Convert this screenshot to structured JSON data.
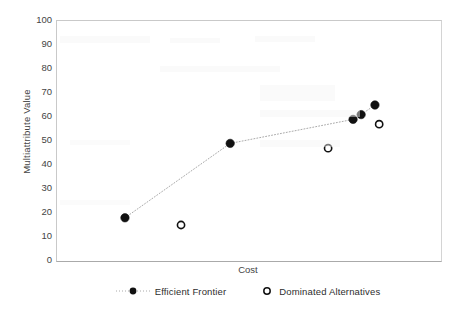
{
  "chart_data": {
    "type": "scatter",
    "title": "",
    "xlabel": "Cost",
    "ylabel": "Multiattribute Value",
    "ylim": [
      0,
      100
    ],
    "ytick_labels": [
      "100",
      "90",
      "80",
      "70",
      "60",
      "50",
      "40",
      "30",
      "20",
      "10",
      "0"
    ],
    "ytick_values": [
      100,
      90,
      80,
      70,
      60,
      50,
      40,
      30,
      20,
      10,
      0
    ],
    "xtick_labels": [],
    "grid": false,
    "legend_position": "bottom",
    "series": [
      {
        "name": "Efficient Frontier",
        "marker": "filled-circle",
        "line": "dotted",
        "points": [
          {
            "x": 0.177,
            "y": 18
          },
          {
            "x": 0.451,
            "y": 49
          },
          {
            "x": 0.771,
            "y": 59
          },
          {
            "x": 0.792,
            "y": 61
          },
          {
            "x": 0.828,
            "y": 65
          }
        ]
      },
      {
        "name": "Dominated Alternatives",
        "marker": "open-circle",
        "line": "none",
        "points": [
          {
            "x": 0.323,
            "y": 15
          },
          {
            "x": 0.706,
            "y": 47
          },
          {
            "x": 0.839,
            "y": 57
          }
        ]
      }
    ]
  },
  "axes": {
    "y_title": "Multiattribute Value",
    "x_title": "Cost"
  },
  "legend": {
    "items": [
      {
        "label": "Efficient Frontier",
        "marker": "filled-circle",
        "line": "dotted"
      },
      {
        "label": "Dominated Alternatives",
        "marker": "open-circle",
        "line": "none"
      }
    ]
  },
  "colors": {
    "marker": "#111111",
    "line": "#aaaaaa",
    "axis": "#c0c0c0",
    "text": "#3a3a3a",
    "background": "#ffffff"
  }
}
